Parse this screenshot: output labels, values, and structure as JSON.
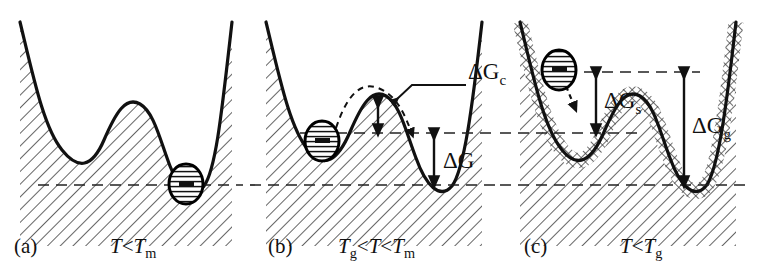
{
  "figure": {
    "kind": "energy-landscape-diagram",
    "background": "#ffffff",
    "ink": "#111111",
    "width": 781,
    "height": 272
  },
  "panels": [
    {
      "id": "a",
      "letter": "(a)",
      "condition_plain": "T < Tm",
      "condition": {
        "pre": "T",
        "rel1": "<",
        "sym": "T",
        "sub": "m"
      },
      "ball_state": "right-well-crystal",
      "hatch_style": "diagonal",
      "levels": [
        185
      ]
    },
    {
      "id": "b",
      "letter": "(b)",
      "condition_plain": "Tg < T < Tm",
      "condition": {
        "pre": "T",
        "presub": "g",
        "rel1": "<",
        "mid": "T",
        "rel2": "<",
        "sym": "T",
        "sub": "m"
      },
      "ball_state": "left-well-metastable",
      "hatch_style": "diagonal",
      "levels": [
        133,
        185
      ]
    },
    {
      "id": "c",
      "letter": "(c)",
      "condition_plain": "T < Tg",
      "condition": {
        "pre": "T",
        "rel1": "<",
        "sym": "T",
        "sub": "g"
      },
      "ball_state": "frozen-on-slope",
      "hatch_style": "diagonal-plus-crosshatch-band",
      "levels": [
        72,
        133,
        185
      ]
    }
  ],
  "annotations": {
    "delta_gc": {
      "base": "ΔG",
      "sub": "c",
      "meaning": "activation-barrier-for-crystallization",
      "panel": "b"
    },
    "delta_g": {
      "base": "ΔG",
      "sub": "",
      "meaning": "driving-force-crystallization",
      "panel": "b"
    },
    "delta_gs": {
      "base": "ΔG",
      "sub": "s",
      "meaning": "supercooled-liquid-energy-drop",
      "panel": "c"
    },
    "delta_gg": {
      "base": "ΔG",
      "sub": "g",
      "meaning": "glass-to-crystal-energy-drop",
      "panel": "c"
    }
  },
  "colors": {
    "curve": "#111111",
    "hatch": "#555555",
    "dashed_level": "#222222",
    "ball_fill": "#ffffff",
    "ball_stroke": "#000000"
  }
}
